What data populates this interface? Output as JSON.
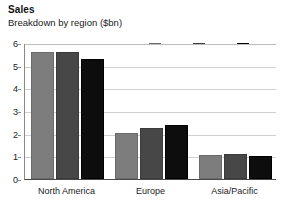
{
  "chart_data": {
    "type": "bar",
    "title": "Sales",
    "subtitle": "Breakdown by region ($bn)",
    "xlabel": "",
    "ylabel": "",
    "ylim": [
      0,
      6
    ],
    "ytick_step": 1,
    "yticks": [
      "0",
      "1",
      "2",
      "3",
      "4",
      "5",
      "6"
    ],
    "grid": true,
    "legend_position": "top-right",
    "categories": [
      "North America",
      "Europe",
      "Asia/Pacific"
    ],
    "series": [
      {
        "name": "1996",
        "color": "#7d7d7d",
        "values": [
          5.6,
          2.05,
          1.05
        ]
      },
      {
        "name": "1997",
        "color": "#474747",
        "values": [
          5.6,
          2.25,
          1.1
        ]
      },
      {
        "name": "1998",
        "color": "#0d0d0d",
        "values": [
          5.3,
          2.4,
          1.0
        ]
      }
    ]
  }
}
